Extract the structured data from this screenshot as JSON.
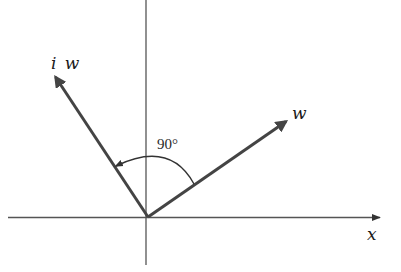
{
  "diagram": {
    "colors": {
      "axis": "#555555",
      "vector": "#444444",
      "arc": "#333333",
      "text": "#1a1a1a",
      "background": "#ffffff"
    },
    "origin": {
      "x": 148,
      "y": 217
    },
    "axes": {
      "x_axis": {
        "label": "x",
        "x1": 8,
        "x2": 380,
        "y": 217
      },
      "y_axis": {
        "x": 146,
        "y1": 0,
        "y2": 265
      }
    },
    "vectors": [
      {
        "id": "w",
        "label": "w",
        "tip": {
          "x": 288,
          "y": 120
        }
      },
      {
        "id": "iw",
        "label": "iw",
        "tip": {
          "x": 54,
          "y": 75
        }
      }
    ],
    "angle_marker": {
      "label": "90°",
      "from_vector": "w",
      "to_vector": "iw",
      "direction": "counterclockwise"
    },
    "labels": {
      "x_axis": "x",
      "w": "w",
      "iw_i": "i",
      "iw_w": "w",
      "angle": "90°"
    }
  }
}
